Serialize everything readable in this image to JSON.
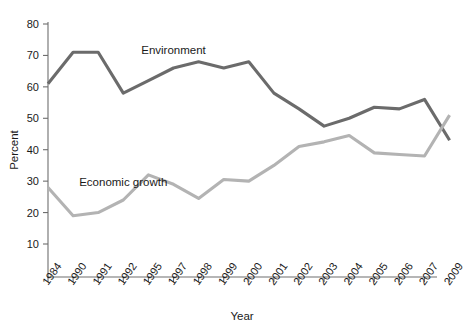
{
  "chart_data": {
    "type": "line",
    "title": "",
    "xlabel": "Year",
    "ylabel": "Percent",
    "categories": [
      "1984",
      "1990",
      "1991",
      "1992",
      "1995",
      "1997",
      "1998",
      "1999",
      "2000",
      "2001",
      "2002",
      "2003",
      "2004",
      "2005",
      "2006",
      "2007",
      "2009"
    ],
    "ylim": [
      0,
      80
    ],
    "yticks": [
      10,
      20,
      30,
      40,
      50,
      60,
      70,
      80
    ],
    "ytick_labels": [
      "10",
      "20",
      "30",
      "40",
      "50",
      "60",
      "70",
      "80"
    ],
    "grid": false,
    "legend_position": "inline-annotation",
    "series": [
      {
        "name": "Environment",
        "color": "#6b6b6b",
        "label_x_category": "1997",
        "values": [
          61,
          71,
          71,
          58,
          62,
          66,
          68,
          66,
          68,
          58,
          53,
          47.5,
          50,
          53.5,
          53,
          56,
          43
        ]
      },
      {
        "name": "Economic growth",
        "color": "#b3b3b3",
        "label_x_category": "1992",
        "values": [
          28,
          19,
          20,
          24,
          32,
          29,
          24.5,
          30.5,
          30,
          35,
          41,
          42.5,
          44.5,
          39,
          38.5,
          38,
          51
        ]
      }
    ],
    "annotations": [
      {
        "text": "Environment",
        "series": "Environment"
      },
      {
        "text": "Economic growth",
        "series": "Economic growth"
      }
    ]
  },
  "axes": {
    "y_axis_title": "Percent",
    "x_axis_title": "Year"
  }
}
